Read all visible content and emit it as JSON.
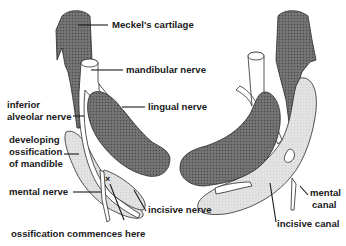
{
  "figure": {
    "colors": {
      "cartilage": "#6e6e6e",
      "ossification": "#e2e2e2",
      "nerve": "#ffffff",
      "outline": "#2a2a2a",
      "text": "#1a1a1a"
    },
    "labels": {
      "meckels_cartilage": "Meckel's cartilage",
      "mandibular_nerve": "mandibular nerve",
      "lingual_nerve": "lingual nerve",
      "inferior_alveolar_line1": "inferior",
      "inferior_alveolar_line2": "alveolar nerve",
      "developing_line1": "developing",
      "developing_line2": "ossification",
      "developing_line3": "of mandible",
      "mental_nerve": "mental nerve",
      "incisive_nerve": "incisive nerve",
      "ossification_commences": "ossification commences here",
      "mental_canal_line1": "mental",
      "mental_canal_line2": "canal",
      "incisive_canal": "incisive canal",
      "cross_mark": "×"
    }
  }
}
